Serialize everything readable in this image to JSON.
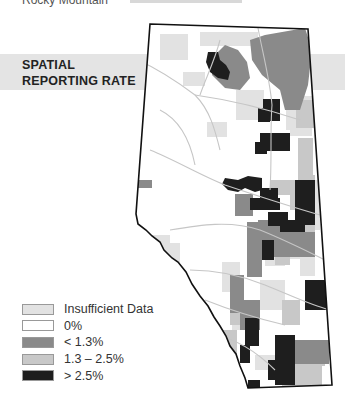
{
  "header": {
    "cut_text": "Rocky Mountain",
    "right_text": "..."
  },
  "title": {
    "line1": "SPATIAL",
    "line2": "REPORTING RATE"
  },
  "legend": {
    "items": [
      {
        "label": "Insufficient Data",
        "color": "#e2e2e2"
      },
      {
        "label": "0%",
        "color": "#ffffff"
      },
      {
        "label": "< 1.3%",
        "color": "#8a8a8a"
      },
      {
        "label": "1.3 – 2.5%",
        "color": "#c8c8c8"
      },
      {
        "label": "> 2.5%",
        "color": "#1e1e1e"
      }
    ]
  },
  "map": {
    "region": "Alberta",
    "colors": {
      "insufficient": "#e2e2e2",
      "zero": "#ffffff",
      "low": "#8a8a8a",
      "mid": "#c8c8c8",
      "high": "#1e1e1e",
      "border": "#111111",
      "rivers": "#c6c6c6"
    }
  }
}
